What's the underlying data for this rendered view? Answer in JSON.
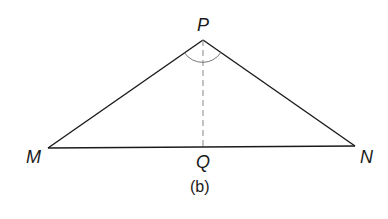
{
  "diagram": {
    "caption": "(b)",
    "colors": {
      "line": "#1a1a1a",
      "altitude": "#888888",
      "arc": "#777777",
      "background": "#ffffff"
    },
    "points": {
      "P": {
        "label": "P",
        "x": 203,
        "y": 40
      },
      "M": {
        "label": "M",
        "x": 48,
        "y": 148
      },
      "N": {
        "label": "N",
        "x": 355,
        "y": 146
      },
      "Q": {
        "label": "Q",
        "x": 203,
        "y": 147
      }
    },
    "segments": [
      {
        "from": "M",
        "to": "P",
        "style": "solid"
      },
      {
        "from": "P",
        "to": "N",
        "style": "solid"
      },
      {
        "from": "M",
        "to": "N",
        "style": "solid"
      },
      {
        "from": "P",
        "to": "Q",
        "style": "dashed"
      }
    ],
    "angle_marks": [
      {
        "vertex": "P",
        "between": [
          "M",
          "N"
        ],
        "type": "arc"
      }
    ]
  }
}
